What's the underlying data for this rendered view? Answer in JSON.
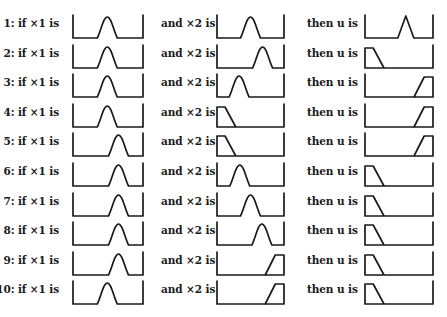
{
  "diagram": {
    "columns": [
      {
        "key": "x1",
        "label_template": "if ×1 is"
      },
      {
        "key": "x2",
        "label_template": "and ×2 is"
      },
      {
        "key": "u",
        "label_template": "then u is"
      }
    ],
    "rules": [
      {
        "id": 1,
        "x1_label": "1: if ×1 is",
        "x2_label": "and ×2 is",
        "u_label": "then u is",
        "x1": {
          "shape": "bell",
          "peak": 0.49
        },
        "x2": {
          "shape": "bell",
          "peak": 0.5
        },
        "u": {
          "shape": "triangle",
          "peak": 0.6
        }
      },
      {
        "id": 2,
        "x1_label": "2: if ×1 is",
        "x2_label": "and ×2 is",
        "u_label": "then u is",
        "x1": {
          "shape": "bell",
          "peak": 0.49
        },
        "x2": {
          "shape": "bell",
          "peak": 0.68
        },
        "u": {
          "shape": "left-shoulder"
        }
      },
      {
        "id": 3,
        "x1_label": "3: if ×1 is",
        "x2_label": "and ×2 is",
        "u_label": "then u is",
        "x1": {
          "shape": "bell",
          "peak": 0.49
        },
        "x2": {
          "shape": "bell",
          "peak": 0.33
        },
        "u": {
          "shape": "right-shoulder"
        }
      },
      {
        "id": 4,
        "x1_label": "4: if ×1 is",
        "x2_label": "and ×2 is",
        "u_label": "then u is",
        "x1": {
          "shape": "bell",
          "peak": 0.49
        },
        "x2": {
          "shape": "left-shoulder"
        },
        "u": {
          "shape": "right-shoulder"
        }
      },
      {
        "id": 5,
        "x1_label": "5: if ×1 is",
        "x2_label": "and ×2 is",
        "u_label": "then u is",
        "x1": {
          "shape": "bell",
          "peak": 0.65
        },
        "x2": {
          "shape": "left-shoulder"
        },
        "u": {
          "shape": "right-shoulder"
        }
      },
      {
        "id": 6,
        "x1_label": "6: if ×1 is",
        "x2_label": "and ×2 is",
        "u_label": "then u is",
        "x1": {
          "shape": "bell",
          "peak": 0.65
        },
        "x2": {
          "shape": "bell",
          "peak": 0.34
        },
        "u": {
          "shape": "left-shoulder"
        }
      },
      {
        "id": 7,
        "x1_label": "7: if ×1 is",
        "x2_label": "and ×2 is",
        "u_label": "then u is",
        "x1": {
          "shape": "bell",
          "peak": 0.65
        },
        "x2": {
          "shape": "bell",
          "peak": 0.5
        },
        "u": {
          "shape": "left-shoulder"
        }
      },
      {
        "id": 8,
        "x1_label": "8: if ×1 is",
        "x2_label": "and ×2 is",
        "u_label": "then u is",
        "x1": {
          "shape": "bell",
          "peak": 0.65
        },
        "x2": {
          "shape": "bell",
          "peak": 0.67
        },
        "u": {
          "shape": "left-shoulder"
        }
      },
      {
        "id": 9,
        "x1_label": "9: if ×1 is",
        "x2_label": "and ×2 is",
        "u_label": "then u is",
        "x1": {
          "shape": "bell",
          "peak": 0.65
        },
        "x2": {
          "shape": "right-shoulder"
        },
        "u": {
          "shape": "left-shoulder"
        }
      },
      {
        "id": 10,
        "x1_label": "10: if ×1 is",
        "x2_label": "and ×2 is",
        "u_label": "then u is",
        "x1": {
          "shape": "bell",
          "peak": 0.49
        },
        "x2": {
          "shape": "right-shoulder"
        },
        "u": {
          "shape": "left-shoulder"
        }
      }
    ]
  },
  "colors": {
    "ink": "#1a1a1a",
    "background": "#ffffff"
  }
}
